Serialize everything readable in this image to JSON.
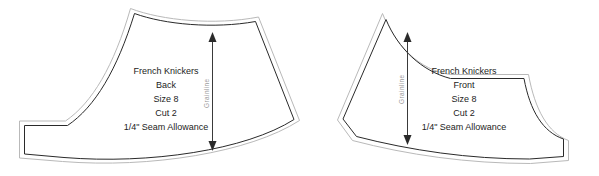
{
  "document": {
    "title": "French Knickers Sewing Pattern",
    "background_color": "#ffffff",
    "cutting_line_color": "#b9b9b9",
    "seam_line_color": "#2a2a2a",
    "text_color": "#1c1c1c",
    "grainline_label_color": "#9a9a9a"
  },
  "pieces": [
    {
      "id": "back",
      "name": "French Knickers Back",
      "labels": [
        "French Knickers",
        "Back",
        "Size 8",
        "Cut 2",
        "1/4\" Seam Allowance"
      ],
      "grainline": {
        "label": "Grainline",
        "orientation": "vertical",
        "arrowheads": "both"
      }
    },
    {
      "id": "front",
      "name": "French Knickers Front",
      "labels": [
        "French Knickers",
        "Front",
        "Size 8",
        "Cut 2",
        "1/4\" Seam Allowance"
      ],
      "grainline": {
        "label": "Grainline",
        "orientation": "vertical",
        "arrowheads": "both"
      }
    }
  ]
}
